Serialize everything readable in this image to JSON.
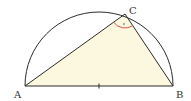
{
  "diagram": {
    "type": "semicircle-inscribed-triangle",
    "points": {
      "A": {
        "label": "A",
        "x": 25,
        "y": 86
      },
      "B": {
        "label": "B",
        "x": 173,
        "y": 86
      },
      "C": {
        "label": "C",
        "x": 125,
        "y": 14
      },
      "O": {
        "x": 99,
        "y": 86
      }
    },
    "radius": 74,
    "colors": {
      "stroke": "#2b2b2b",
      "fill": "#fbf8df",
      "angle_mark": "#d9534f"
    },
    "angle_mark_at": "C",
    "right_angle_dot": true,
    "center_tick": true
  }
}
